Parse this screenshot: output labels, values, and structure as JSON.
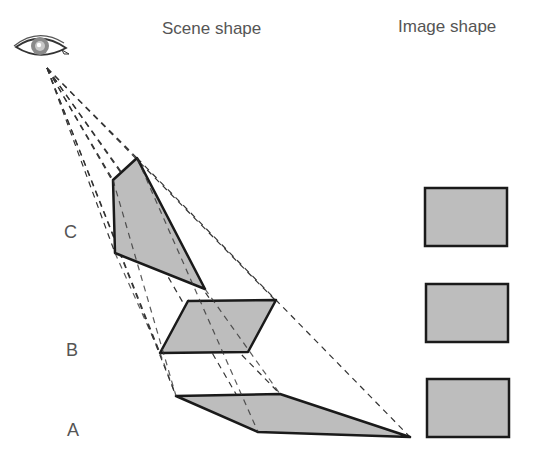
{
  "headers": {
    "scene": "Scene shape",
    "image": "Image shape"
  },
  "labels": {
    "c": "C",
    "b": "B",
    "a": "A"
  },
  "icons": {
    "viewer": "eye-icon"
  },
  "colors": {
    "fill": "#bdbdbd",
    "stroke": "#1a1a1a",
    "dash": "#333333",
    "text": "#555555"
  }
}
